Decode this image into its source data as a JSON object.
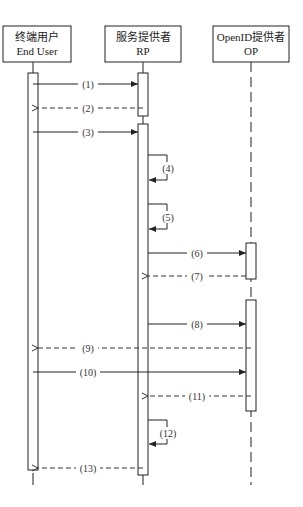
{
  "participants": [
    {
      "id": "user",
      "line1": "终端用户",
      "line2": "End User"
    },
    {
      "id": "rp",
      "line1": "服务提供者",
      "line2": "RP"
    },
    {
      "id": "op",
      "line1": "OpenID提供者",
      "line2": "OP"
    }
  ],
  "messages": [
    {
      "label": "(1)",
      "from": "user",
      "to": "rp",
      "style": "solid"
    },
    {
      "label": "(2)",
      "from": "rp",
      "to": "user",
      "style": "dashed"
    },
    {
      "label": "(3)",
      "from": "user",
      "to": "rp",
      "style": "solid"
    },
    {
      "label": "(4)",
      "from": "rp",
      "to": "rp",
      "style": "self"
    },
    {
      "label": "(5)",
      "from": "rp",
      "to": "rp",
      "style": "self"
    },
    {
      "label": "(6)",
      "from": "rp",
      "to": "op",
      "style": "solid"
    },
    {
      "label": "(7)",
      "from": "op",
      "to": "rp",
      "style": "dashed"
    },
    {
      "label": "(8)",
      "from": "rp",
      "to": "op",
      "style": "solid"
    },
    {
      "label": "(9)",
      "from": "op",
      "to": "user",
      "style": "dashed"
    },
    {
      "label": "(10)",
      "from": "user",
      "to": "op",
      "style": "solid"
    },
    {
      "label": "(11)",
      "from": "op",
      "to": "rp",
      "style": "dashed"
    },
    {
      "label": "(12)",
      "from": "rp",
      "to": "rp",
      "style": "self"
    },
    {
      "label": "(13)",
      "from": "rp",
      "to": "user",
      "style": "dashed"
    }
  ]
}
